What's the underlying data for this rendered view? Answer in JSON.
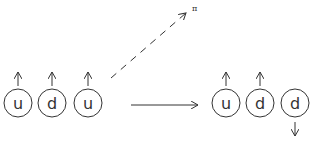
{
  "diagram": {
    "initial_state": {
      "quarks": [
        {
          "label": "u",
          "spin": "up"
        },
        {
          "label": "d",
          "spin": "up"
        },
        {
          "label": "u",
          "spin": "up"
        }
      ]
    },
    "emitted_particle": {
      "label": "π",
      "arrow_style": "dashed"
    },
    "transition_arrow": {
      "arrow_style": "solid"
    },
    "final_state": {
      "quarks": [
        {
          "label": "u",
          "spin": "up"
        },
        {
          "label": "d",
          "spin": "up"
        },
        {
          "label": "d",
          "spin": "down"
        }
      ]
    },
    "colors": {
      "stroke": "#333333",
      "background": "#ffffff"
    }
  }
}
